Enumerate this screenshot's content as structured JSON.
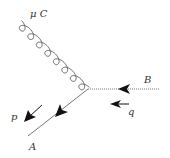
{
  "diagram": {
    "type": "feynman-vertex",
    "labels": {
      "gluon": "μ C",
      "scalar": "B",
      "fermion": "A",
      "momentum_scalar": "q",
      "momentum_fermion": "p"
    },
    "colors": {
      "line": "#555555",
      "arrow": "#111111",
      "text": "#333333"
    },
    "lines": [
      {
        "id": "gluon",
        "style": "curly",
        "from": [
          20,
          22
        ],
        "to": [
          88,
          89
        ],
        "label": "μ C"
      },
      {
        "id": "scalar",
        "style": "dotted",
        "from": [
          160,
          89
        ],
        "to": [
          88,
          89
        ],
        "label": "B"
      },
      {
        "id": "fermion",
        "style": "solid",
        "from": [
          88,
          89
        ],
        "to": [
          28,
          136
        ],
        "label": "A"
      }
    ],
    "momenta": [
      {
        "label": "q",
        "direction": "left"
      },
      {
        "label": "p",
        "direction": "down-left"
      }
    ]
  }
}
